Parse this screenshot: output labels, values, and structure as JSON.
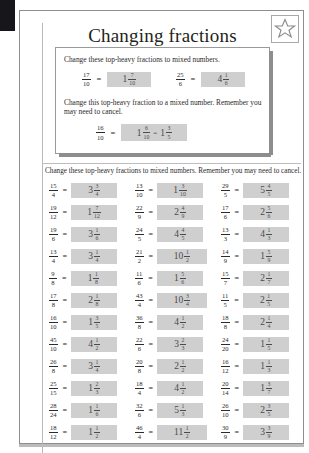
{
  "worksheet": {
    "title": "Changing fractions",
    "star_icon": "star-icon"
  },
  "example_panel": {
    "instruction_1": "Change these top-heavy fractions to mixed numbers.",
    "instruction_2": "Change this top-heavy fraction to a mixed number. Remember you may need to cancel.",
    "examples": [
      {
        "question": {
          "numerator": "17",
          "denominator": "10"
        },
        "equals": "=",
        "answer": {
          "whole": "1",
          "numerator": "7",
          "denominator": "10"
        }
      },
      {
        "question": {
          "numerator": "25",
          "denominator": "6"
        },
        "equals": "=",
        "answer": {
          "whole": "4",
          "numerator": "1",
          "denominator": "6"
        }
      }
    ],
    "cancel_example": {
      "question": {
        "numerator": "16",
        "denominator": "10"
      },
      "equals": "=",
      "answer": {
        "whole": "1",
        "numerator": "6",
        "denominator": "10"
      },
      "mid_equals": "=",
      "cancelled": {
        "whole": "1",
        "numerator": "3",
        "denominator": "5"
      }
    }
  },
  "exercise": {
    "instruction": "Change these top-heavy fractions to mixed numbers. Remember you may need to cancel.",
    "equals": "=",
    "columns": [
      {
        "problems": [
          {
            "numerator": "15",
            "denominator": "4",
            "answer": {
              "whole": "3",
              "numerator": "3",
              "denominator": "4"
            }
          },
          {
            "numerator": "19",
            "denominator": "12",
            "answer": {
              "whole": "1",
              "numerator": "7",
              "denominator": "12"
            }
          },
          {
            "numerator": "19",
            "denominator": "6",
            "answer": {
              "whole": "3",
              "numerator": "1",
              "denominator": "6"
            }
          },
          {
            "numerator": "13",
            "denominator": "4",
            "answer": {
              "whole": "3",
              "numerator": "1",
              "denominator": "4"
            }
          },
          {
            "numerator": "9",
            "denominator": "8",
            "answer": {
              "whole": "1",
              "numerator": "1",
              "denominator": "8"
            }
          },
          {
            "numerator": "17",
            "denominator": "8",
            "answer": {
              "whole": "2",
              "numerator": "1",
              "denominator": "8"
            }
          },
          {
            "numerator": "16",
            "denominator": "10",
            "answer": {
              "whole": "1",
              "numerator": "3",
              "denominator": "5"
            }
          },
          {
            "numerator": "45",
            "denominator": "10",
            "answer": {
              "whole": "4",
              "numerator": "1",
              "denominator": "2"
            }
          },
          {
            "numerator": "26",
            "denominator": "8",
            "answer": {
              "whole": "3",
              "numerator": "1",
              "denominator": "4"
            }
          },
          {
            "numerator": "25",
            "denominator": "15",
            "answer": {
              "whole": "1",
              "numerator": "2",
              "denominator": "3"
            }
          },
          {
            "numerator": "28",
            "denominator": "24",
            "answer": {
              "whole": "1",
              "numerator": "1",
              "denominator": "6"
            }
          },
          {
            "numerator": "18",
            "denominator": "12",
            "answer": {
              "whole": "1",
              "numerator": "1",
              "denominator": "2"
            }
          }
        ]
      },
      {
        "problems": [
          {
            "numerator": "13",
            "denominator": "10",
            "answer": {
              "whole": "1",
              "numerator": "3",
              "denominator": "10"
            }
          },
          {
            "numerator": "22",
            "denominator": "9",
            "answer": {
              "whole": "2",
              "numerator": "4",
              "denominator": "9"
            }
          },
          {
            "numerator": "24",
            "denominator": "5",
            "answer": {
              "whole": "4",
              "numerator": "4",
              "denominator": "5"
            }
          },
          {
            "numerator": "21",
            "denominator": "2",
            "answer": {
              "whole": "10",
              "numerator": "1",
              "denominator": "2"
            }
          },
          {
            "numerator": "11",
            "denominator": "6",
            "answer": {
              "whole": "1",
              "numerator": "5",
              "denominator": "6"
            }
          },
          {
            "numerator": "43",
            "denominator": "4",
            "answer": {
              "whole": "10",
              "numerator": "3",
              "denominator": "4"
            }
          },
          {
            "numerator": "36",
            "denominator": "8",
            "answer": {
              "whole": "4",
              "numerator": "1",
              "denominator": "2"
            }
          },
          {
            "numerator": "22",
            "denominator": "6",
            "answer": {
              "whole": "3",
              "numerator": "2",
              "denominator": "3"
            }
          },
          {
            "numerator": "20",
            "denominator": "8",
            "answer": {
              "whole": "2",
              "numerator": "1",
              "denominator": "2"
            }
          },
          {
            "numerator": "18",
            "denominator": "4",
            "answer": {
              "whole": "4",
              "numerator": "1",
              "denominator": "2"
            }
          },
          {
            "numerator": "32",
            "denominator": "6",
            "answer": {
              "whole": "5",
              "numerator": "1",
              "denominator": "3"
            }
          },
          {
            "numerator": "46",
            "denominator": "4",
            "answer": {
              "whole": "11",
              "numerator": "1",
              "denominator": "2"
            }
          }
        ]
      },
      {
        "problems": [
          {
            "numerator": "29",
            "denominator": "5",
            "answer": {
              "whole": "5",
              "numerator": "4",
              "denominator": "5"
            }
          },
          {
            "numerator": "17",
            "denominator": "6",
            "answer": {
              "whole": "2",
              "numerator": "5",
              "denominator": "6"
            }
          },
          {
            "numerator": "13",
            "denominator": "3",
            "answer": {
              "whole": "4",
              "numerator": "1",
              "denominator": "3"
            }
          },
          {
            "numerator": "14",
            "denominator": "9",
            "answer": {
              "whole": "1",
              "numerator": "5",
              "denominator": "9"
            }
          },
          {
            "numerator": "15",
            "denominator": "7",
            "answer": {
              "whole": "2",
              "numerator": "1",
              "denominator": "7"
            }
          },
          {
            "numerator": "11",
            "denominator": "5",
            "answer": {
              "whole": "2",
              "numerator": "1",
              "denominator": "5"
            }
          },
          {
            "numerator": "18",
            "denominator": "8",
            "answer": {
              "whole": "2",
              "numerator": "1",
              "denominator": "4"
            }
          },
          {
            "numerator": "24",
            "denominator": "20",
            "answer": {
              "whole": "1",
              "numerator": "1",
              "denominator": "5"
            }
          },
          {
            "numerator": "16",
            "denominator": "12",
            "answer": {
              "whole": "1",
              "numerator": "1",
              "denominator": "3"
            }
          },
          {
            "numerator": "20",
            "denominator": "14",
            "answer": {
              "whole": "1",
              "numerator": "3",
              "denominator": "7"
            }
          },
          {
            "numerator": "26",
            "denominator": "10",
            "answer": {
              "whole": "2",
              "numerator": "3",
              "denominator": "5"
            }
          },
          {
            "numerator": "30",
            "denominator": "9",
            "answer": {
              "whole": "3",
              "numerator": "3",
              "denominator": "9"
            }
          }
        ]
      }
    ]
  }
}
